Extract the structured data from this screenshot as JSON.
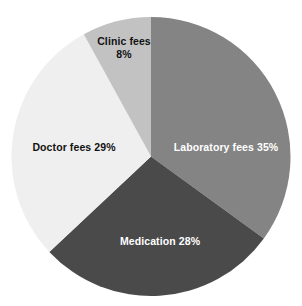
{
  "chart_data": {
    "type": "pie",
    "title": "",
    "subtitle": "",
    "xlabel": "",
    "ylabel": "",
    "legend": "none",
    "grid": false,
    "units": "percent",
    "total": 100,
    "categories": [
      "Laboratory fees",
      "Medication",
      "Doctor fees",
      "Clinic fees"
    ],
    "values": [
      35,
      28,
      29,
      8
    ],
    "slices": [
      {
        "name": "Laboratory fees",
        "value": 35,
        "label": "Laboratory fees 35%",
        "percent_text": "35%",
        "color": "#848484",
        "text_color": "#ffffff",
        "start_angle_deg": 0,
        "end_angle_deg": 126
      },
      {
        "name": "Medication",
        "value": 28,
        "label": "Medication 28%",
        "percent_text": "28%",
        "color": "#4a4a4a",
        "text_color": "#ffffff",
        "start_angle_deg": 126,
        "end_angle_deg": 226.8
      },
      {
        "name": "Doctor fees",
        "value": 29,
        "label": "Doctor fees 29%",
        "percent_text": "29%",
        "color": "#efefef",
        "text_color": "#121212",
        "start_angle_deg": 226.8,
        "end_angle_deg": 331.2
      },
      {
        "name": "Clinic fees",
        "value": 8,
        "label_line1": "Clinic fees",
        "label_line2": "8%",
        "label": "Clinic fees 8%",
        "percent_text": "8%",
        "color": "#c2c2c2",
        "text_color": "#121212",
        "start_angle_deg": 331.2,
        "end_angle_deg": 360
      }
    ],
    "background_color": "#ffffff"
  }
}
